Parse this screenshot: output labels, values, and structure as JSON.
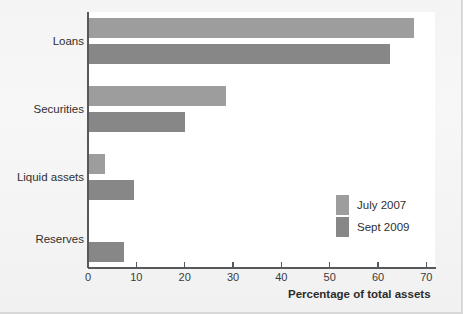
{
  "chart_data": {
    "type": "bar",
    "orientation": "horizontal",
    "title": "",
    "xlabel": "Percentage of total assets",
    "ylabel": "",
    "categories": [
      "Loans",
      "Securities",
      "Liquid assets",
      "Reserves"
    ],
    "series": [
      {
        "name": "July 2007",
        "color": "#9d9d9d",
        "values": [
          67.5,
          28.5,
          3.5,
          0.3
        ]
      },
      {
        "name": "Sept 2009",
        "color": "#878787",
        "values": [
          62.5,
          20.0,
          9.5,
          7.5
        ]
      }
    ],
    "xlim": [
      0,
      72
    ],
    "xticks": [
      0,
      10,
      20,
      30,
      40,
      50,
      60,
      70
    ],
    "xtick_labels": [
      "0",
      "10",
      "20",
      "30",
      "40",
      "50",
      "60",
      "70"
    ],
    "grid": false,
    "legend_position": "inside-right"
  },
  "legend": {
    "entries": [
      {
        "label": "July 2007",
        "color": "#9d9d9d"
      },
      {
        "label": "Sept 2009",
        "color": "#878787"
      }
    ]
  },
  "axis": {
    "x_title": "Percentage of total assets"
  },
  "colors": {
    "series_july_2007": "#9d9d9d",
    "series_sept_2009": "#878787",
    "axis_line": "#55595c",
    "text": "#2f2f2f",
    "plot_background": "#ffffff",
    "figure_background": "#f2f2f2"
  }
}
